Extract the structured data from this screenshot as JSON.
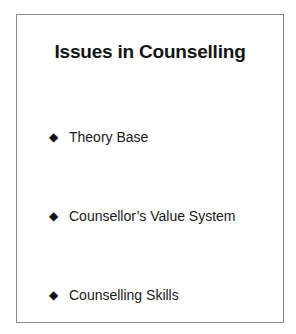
{
  "slide": {
    "title": "Issues in Counselling",
    "bullet_glyph": "◆",
    "items": [
      {
        "label": "Theory Base"
      },
      {
        "label": "Counsellor’s Value System"
      },
      {
        "label": "Counselling Skills"
      }
    ]
  }
}
